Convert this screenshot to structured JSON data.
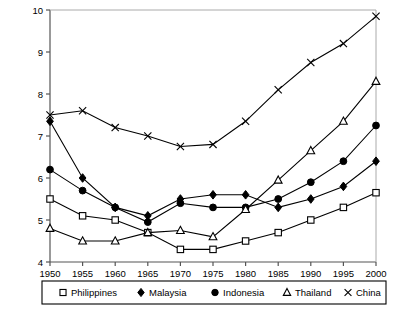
{
  "chart_data": {
    "type": "line",
    "title": "",
    "xlabel": "",
    "ylabel": "",
    "x": [
      1950,
      1955,
      1960,
      1965,
      1970,
      1975,
      1980,
      1985,
      1990,
      1995,
      2000
    ],
    "xtick_labels": [
      "1950",
      "1955",
      "1960",
      "1965",
      "1970",
      "1975",
      "1980",
      "1985",
      "1990",
      "1995",
      "2000"
    ],
    "ytick_labels": [
      "4",
      "5",
      "6",
      "7",
      "8",
      "9",
      "10"
    ],
    "yticks": [
      4,
      5,
      6,
      7,
      8,
      9,
      10
    ],
    "xlim": [
      1950,
      2000
    ],
    "ylim": [
      4,
      10
    ],
    "grid": false,
    "legend_position": "bottom",
    "series": [
      {
        "name": "Philippines",
        "marker": "open-square",
        "color": "#000000",
        "values": [
          5.5,
          5.1,
          5.0,
          4.7,
          4.3,
          4.3,
          4.5,
          4.7,
          5.0,
          5.3,
          5.65
        ]
      },
      {
        "name": "Malaysia",
        "marker": "filled-diamond",
        "color": "#000000",
        "values": [
          7.35,
          6.0,
          5.3,
          5.1,
          5.5,
          5.6,
          5.6,
          5.3,
          5.5,
          5.8,
          6.4
        ]
      },
      {
        "name": "Indonesia",
        "marker": "filled-circle",
        "color": "#000000",
        "values": [
          6.2,
          5.7,
          5.3,
          4.95,
          5.4,
          5.3,
          5.3,
          5.5,
          5.9,
          6.4,
          7.25
        ]
      },
      {
        "name": "Thailand",
        "marker": "open-triangle",
        "color": "#000000",
        "values": [
          4.8,
          4.5,
          4.5,
          4.7,
          4.75,
          4.6,
          5.25,
          5.95,
          6.65,
          7.35,
          8.3
        ]
      },
      {
        "name": "China",
        "marker": "cross",
        "color": "#000000",
        "values": [
          7.5,
          7.6,
          7.2,
          7.0,
          6.75,
          6.8,
          7.35,
          8.1,
          8.75,
          9.2,
          9.85
        ]
      }
    ]
  },
  "legend": {
    "entries": [
      {
        "label": "Philippines",
        "marker": "open-square"
      },
      {
        "label": "Malaysia",
        "marker": "filled-diamond"
      },
      {
        "label": "Indonesia",
        "marker": "filled-circle"
      },
      {
        "label": "Thailand",
        "marker": "open-triangle"
      },
      {
        "label": "China",
        "marker": "cross"
      }
    ]
  },
  "axes": {
    "y_min_label": "4",
    "y_max_label": "10"
  }
}
